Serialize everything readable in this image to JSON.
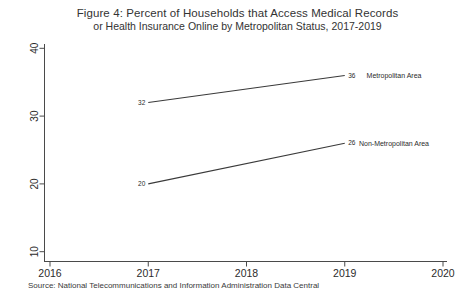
{
  "source": "Source: National Telecommunications and Information Administration Data Central",
  "colors": {
    "line": "#3a3a3a",
    "axis": "#4a4a4a",
    "text": "#2b2b2b",
    "background": "#ffffff"
  },
  "chart_data": {
    "type": "line",
    "title": "Figure 4: Percent of Households that Access Medical Records",
    "subtitle": "or Health Insurance Online by Metropolitan Status, 2017-2019",
    "x": [
      2017,
      2019
    ],
    "series": [
      {
        "name": "Metropolitan Area",
        "values": [
          32,
          36
        ]
      },
      {
        "name": "Non-Metropolitan Area",
        "values": [
          20,
          26
        ]
      }
    ],
    "xlim": [
      2016,
      2020
    ],
    "ylim": [
      10,
      40
    ],
    "xticks": [
      2016,
      2017,
      2018,
      2019,
      2020
    ],
    "yticks": [
      10,
      20,
      30,
      40
    ],
    "grid": false,
    "point_labels": true,
    "legend_position": "right-of-line-ends",
    "xlabel": "",
    "ylabel": ""
  }
}
